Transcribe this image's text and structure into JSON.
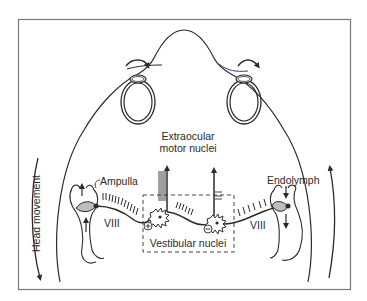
{
  "diagram": {
    "labels": {
      "extraocular_line1": "Extraocular",
      "extraocular_line2": "motor nuclei",
      "ampulla": "Ampulla",
      "endolymph": "Endolymph",
      "nerve_left": "VIII",
      "nerve_right": "VIII",
      "vestibular_nuclei": "Vestibular nuclei",
      "head_movement": "Head movement",
      "excitatory_sign": "+",
      "inhibitory_sign": "−"
    },
    "colors": {
      "line": "#2b2b2b",
      "frame": "#7a7a7a",
      "cupula_fill": "#bdbdbd",
      "background": "#ffffff"
    },
    "components": [
      "head-outline",
      "left-eye",
      "right-eye",
      "left-eye-rotation-arrow",
      "right-eye-rotation-arrow",
      "left-semicircular-canal",
      "right-semicircular-canal",
      "left-vestibular-nerve",
      "right-vestibular-nerve",
      "vestibular-nuclei-box",
      "excitatory-neuron",
      "inhibitory-neuron",
      "left-motor-axon-arrow",
      "right-motor-axon-arrow",
      "head-movement-arrows"
    ]
  }
}
